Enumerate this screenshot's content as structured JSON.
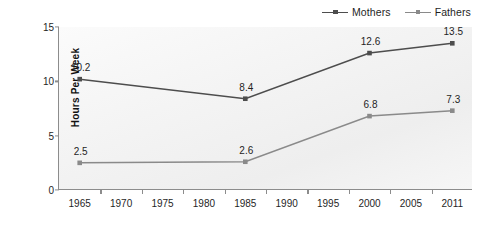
{
  "chart_data": {
    "type": "line",
    "title": "",
    "xlabel": "",
    "ylabel": "Hours Per Week",
    "categories": [
      "1965",
      "1970",
      "1975",
      "1980",
      "1985",
      "1990",
      "1995",
      "2000",
      "2005",
      "2011"
    ],
    "yticks": [
      "0",
      "5",
      "10",
      "15"
    ],
    "ylim": [
      0,
      15
    ],
    "grid": false,
    "legend_position": "top-right",
    "series": [
      {
        "name": "Mothers",
        "color": "#4d4d4d",
        "points": [
          {
            "x": "1965",
            "y": 10.2,
            "label": "10.2"
          },
          {
            "x": "1985",
            "y": 8.4,
            "label": "8.4"
          },
          {
            "x": "2000",
            "y": 12.6,
            "label": "12.6"
          },
          {
            "x": "2011",
            "y": 13.5,
            "label": "13.5"
          }
        ]
      },
      {
        "name": "Fathers",
        "color": "#8a8a8a",
        "points": [
          {
            "x": "1965",
            "y": 2.5,
            "label": "2.5"
          },
          {
            "x": "1985",
            "y": 2.6,
            "label": "2.6"
          },
          {
            "x": "2000",
            "y": 6.8,
            "label": "6.8"
          },
          {
            "x": "2011",
            "y": 7.3,
            "label": "7.3"
          }
        ]
      }
    ]
  },
  "legend": {
    "items": [
      {
        "label": "Mothers",
        "color": "#4d4d4d"
      },
      {
        "label": "Fathers",
        "color": "#8a8a8a"
      }
    ]
  },
  "axes": {
    "y_title": "Hours Per Week",
    "axis_color": "#8c8c8c"
  }
}
